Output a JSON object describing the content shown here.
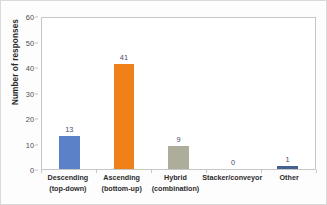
{
  "chart_data": {
    "type": "bar",
    "title": "",
    "xlabel": "",
    "ylabel": "Number of responses",
    "ylim": [
      0,
      60
    ],
    "ytick_labels": [
      "0",
      "10",
      "20",
      "30",
      "40",
      "50",
      "60"
    ],
    "ytick_values": [
      0,
      10,
      20,
      30,
      40,
      50,
      60
    ],
    "grid": false,
    "legend": "none",
    "categories": [
      "Descending (top-down)",
      "Ascending (bottom-up)",
      "Hybrid (combination)",
      "Stacker/conveyor",
      "Other"
    ],
    "category_lines": [
      [
        "Descending",
        "(top-down)"
      ],
      [
        "Ascending",
        "(bottom-up)"
      ],
      [
        "Hybrid",
        "(combination)"
      ],
      [
        "Stacker/conveyor",
        ""
      ],
      [
        "Other",
        ""
      ]
    ],
    "values": [
      13,
      41,
      9,
      0,
      1
    ],
    "value_labels": [
      "13",
      "41",
      "9",
      "0",
      "1"
    ],
    "bar_colors": [
      "#5b82c8",
      "#f08119",
      "#aeac9b",
      "#5b82c8",
      "#44618f"
    ]
  },
  "colors": {
    "blue": "#5b82c8",
    "orange": "#f08119",
    "tan": "#aeac9b",
    "dark_blue": "#44618f",
    "axis": "#c6c6c6",
    "tick_text": "#4d4d4d",
    "label_text": "#2b2b2b",
    "value_text": "#4a4a66",
    "plot_background": "#ffffff",
    "page_background": "#fdfdfd"
  }
}
